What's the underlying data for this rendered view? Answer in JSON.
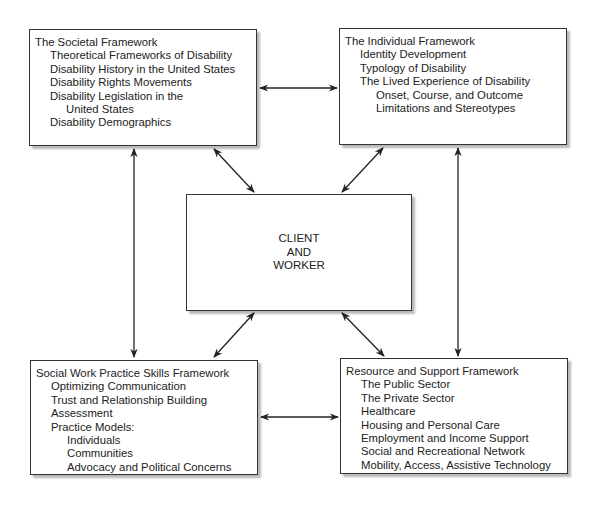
{
  "diagram": {
    "societal": {
      "title": "The Societal Framework",
      "items": [
        {
          "text": "Theoretical Frameworks of Disability",
          "level": 1
        },
        {
          "text": "Disability History in the United States",
          "level": 1
        },
        {
          "text": "Disability Rights Movements",
          "level": 1
        },
        {
          "text": "Disability Legislation in the",
          "level": 1
        },
        {
          "text": "United States",
          "level": 2
        },
        {
          "text": "Disability Demographics",
          "level": 1
        }
      ]
    },
    "individual": {
      "title": "The Individual Framework",
      "items": [
        {
          "text": "Identity Development",
          "level": 1
        },
        {
          "text": "Typology of Disability",
          "level": 1
        },
        {
          "text": "The Lived Experience of Disability",
          "level": 1
        },
        {
          "text": "Onset, Course, and Outcome",
          "level": 2
        },
        {
          "text": "Limitations and Stereotypes",
          "level": 2
        }
      ]
    },
    "center": {
      "lines": [
        "CLIENT",
        "AND",
        "WORKER"
      ]
    },
    "social_work": {
      "title": "Social Work Practice Skills Framework",
      "items": [
        {
          "text": "Optimizing Communication",
          "level": 1
        },
        {
          "text": "Trust and Relationship Building",
          "level": 1
        },
        {
          "text": "Assessment",
          "level": 1
        },
        {
          "text": "Practice Models:",
          "level": 1
        },
        {
          "text": "Individuals",
          "level": 2
        },
        {
          "text": "Communities",
          "level": 2
        },
        {
          "text": "Advocacy and Political Concerns",
          "level": 2
        }
      ]
    },
    "resource": {
      "title": "Resource and Support Framework",
      "items": [
        {
          "text": "The Public Sector",
          "level": 1
        },
        {
          "text": "The Private Sector",
          "level": 1
        },
        {
          "text": "Healthcare",
          "level": 1
        },
        {
          "text": "Housing and Personal Care",
          "level": 1
        },
        {
          "text": "Employment and Income Support",
          "level": 1
        },
        {
          "text": "Social and Recreational Network",
          "level": 1
        },
        {
          "text": "Mobility, Access, Assistive Technology",
          "level": 1
        }
      ]
    },
    "connections": [
      {
        "from": "societal",
        "to": "individual",
        "type": "bidirectional"
      },
      {
        "from": "societal",
        "to": "social_work",
        "type": "bidirectional"
      },
      {
        "from": "individual",
        "to": "resource",
        "type": "bidirectional"
      },
      {
        "from": "social_work",
        "to": "resource",
        "type": "bidirectional"
      },
      {
        "from": "societal",
        "to": "center",
        "type": "bidirectional"
      },
      {
        "from": "individual",
        "to": "center",
        "type": "bidirectional"
      },
      {
        "from": "social_work",
        "to": "center",
        "type": "bidirectional"
      },
      {
        "from": "resource",
        "to": "center",
        "type": "bidirectional"
      }
    ],
    "colors": {
      "border": "#333333",
      "text": "#222222",
      "background": "#ffffff"
    }
  }
}
